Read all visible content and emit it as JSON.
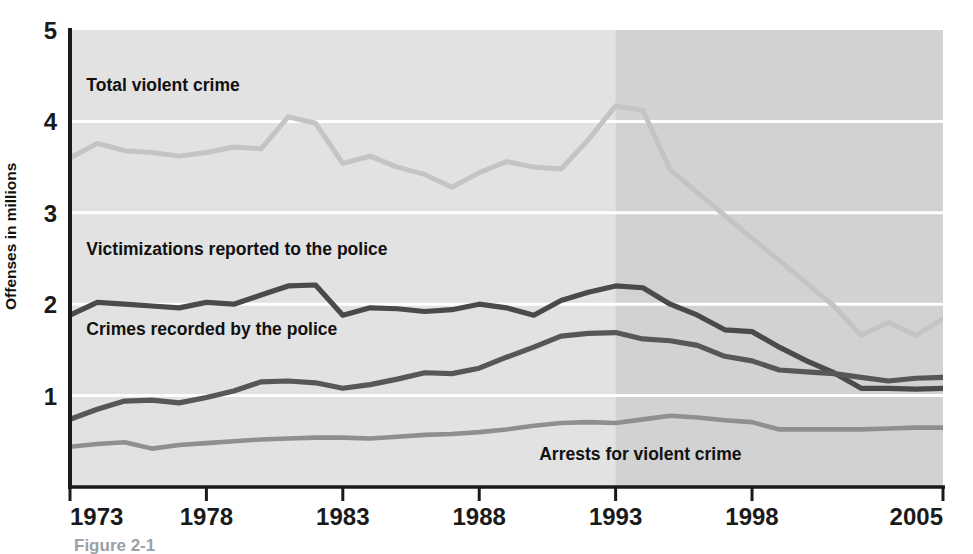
{
  "figure": {
    "caption": "Figure 2-1",
    "ylabel": "Offenses in millions",
    "background_color": "#ffffff",
    "plot_fill_light": "#e2e2e2",
    "plot_fill_dark": "#d2d2d2",
    "gridline_color": "#ffffff",
    "axis_color": "#1a1a1a"
  },
  "axis": {
    "y_ticks": [
      "1",
      "2",
      "3",
      "4",
      "5"
    ],
    "x_ticks": [
      "1973",
      "1978",
      "1983",
      "1988",
      "1993",
      "1998",
      "2005"
    ]
  },
  "series_labels": {
    "total": "Total violent crime",
    "victimizations": "Victimizations reported to the police",
    "recorded": "Crimes recorded by the police",
    "arrests": "Arrests for violent crime"
  },
  "chart_data": {
    "type": "line",
    "title": "",
    "xlabel": "",
    "ylabel": "Offenses in millions",
    "xlim": [
      1973,
      2005
    ],
    "ylim": [
      0,
      5
    ],
    "yticks": [
      1,
      2,
      3,
      4,
      5
    ],
    "xticks": [
      1973,
      1978,
      1983,
      1988,
      1993,
      1998,
      2005
    ],
    "grid": "horizontal-white",
    "legend": "inline-labels",
    "shaded_region": {
      "from": 1993,
      "to": 2005,
      "note": "darker background band beginning at 1993"
    },
    "x": [
      1973,
      1974,
      1975,
      1976,
      1977,
      1978,
      1979,
      1980,
      1981,
      1982,
      1983,
      1984,
      1985,
      1986,
      1987,
      1988,
      1989,
      1990,
      1991,
      1992,
      1993,
      1994,
      1995,
      1996,
      1997,
      1998,
      1999,
      2000,
      2001,
      2002,
      2003,
      2004,
      2005
    ],
    "series": [
      {
        "name": "Total violent crime",
        "color": "#c4c4c4",
        "values": [
          3.6,
          3.76,
          3.68,
          3.66,
          3.62,
          3.66,
          3.72,
          3.7,
          4.05,
          3.98,
          3.54,
          3.62,
          3.5,
          3.42,
          3.28,
          3.44,
          3.56,
          3.5,
          3.48,
          3.8,
          4.17,
          4.12,
          3.47,
          3.22,
          2.97,
          2.72,
          2.48,
          2.23,
          1.98,
          1.66,
          1.8,
          1.66,
          1.84
        ]
      },
      {
        "name": "Victimizations reported to the police",
        "color": "#4a4a4a",
        "values": [
          1.88,
          2.02,
          2.0,
          1.98,
          1.96,
          2.02,
          2.0,
          2.1,
          2.2,
          2.21,
          1.88,
          1.96,
          1.95,
          1.92,
          1.94,
          2.0,
          1.96,
          1.88,
          2.04,
          2.13,
          2.2,
          2.18,
          2.0,
          1.88,
          1.72,
          1.7,
          1.53,
          1.38,
          1.25,
          1.08,
          1.08,
          1.07,
          1.08
        ]
      },
      {
        "name": "Crimes recorded by the police",
        "color": "#575757",
        "values": [
          0.74,
          0.85,
          0.94,
          0.95,
          0.92,
          0.98,
          1.05,
          1.15,
          1.16,
          1.14,
          1.08,
          1.12,
          1.18,
          1.25,
          1.24,
          1.3,
          1.42,
          1.53,
          1.65,
          1.68,
          1.69,
          1.62,
          1.6,
          1.55,
          1.43,
          1.38,
          1.28,
          1.26,
          1.24,
          1.2,
          1.16,
          1.19,
          1.2
        ]
      },
      {
        "name": "Arrests for violent crime",
        "color": "#8f8f8f",
        "values": [
          0.44,
          0.47,
          0.49,
          0.42,
          0.46,
          0.48,
          0.5,
          0.52,
          0.53,
          0.54,
          0.54,
          0.53,
          0.55,
          0.57,
          0.58,
          0.6,
          0.63,
          0.67,
          0.7,
          0.71,
          0.7,
          0.74,
          0.78,
          0.76,
          0.73,
          0.71,
          0.63,
          0.63,
          0.63,
          0.63,
          0.64,
          0.65,
          0.65
        ]
      }
    ]
  },
  "annotations": [
    {
      "name": "total-violent-crime-label",
      "text": "Total violent crime",
      "x": 1973.6,
      "y": 4.33
    },
    {
      "name": "victimizations-label",
      "text": "Victimizations reported to the police",
      "x": 1973.6,
      "y": 2.54
    },
    {
      "name": "crimes-recorded-label",
      "text": "Crimes recorded by the police",
      "x": 1973.6,
      "y": 1.66
    },
    {
      "name": "arrests-label",
      "text": "Arrests for violent crime",
      "x": 1990.2,
      "y": 0.3
    }
  ]
}
